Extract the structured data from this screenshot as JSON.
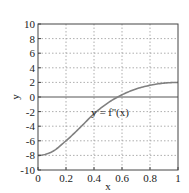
{
  "chart_data": {
    "type": "line",
    "title": "",
    "xlabel": "x",
    "ylabel": "y",
    "xlim": [
      0,
      1
    ],
    "ylim": [
      -10,
      10
    ],
    "grid": true,
    "xticks": [
      0,
      0.2,
      0.4,
      0.6,
      0.8,
      1
    ],
    "xtick_labels": [
      "0",
      "0.2",
      "0.4",
      "0.6",
      "0.8",
      "1"
    ],
    "yticks": [
      -10,
      -8,
      -6,
      -4,
      -2,
      0,
      2,
      4,
      6,
      8,
      10
    ],
    "ytick_labels": [
      "-10",
      "-8",
      "-6",
      "-4",
      "-2",
      "0",
      "2",
      "4",
      "6",
      "8",
      "10"
    ],
    "hline": 0,
    "series": [
      {
        "name": "y = f''(x)",
        "color": "#808080",
        "x": [
          0,
          0.1,
          0.2,
          0.3,
          0.4,
          0.5,
          0.6,
          0.7,
          0.8,
          0.9,
          1.0
        ],
        "y": [
          -8.0,
          -7.5,
          -6.0,
          -4.2,
          -2.3,
          -0.8,
          0.3,
          1.1,
          1.6,
          1.9,
          2.0
        ]
      }
    ],
    "annotations": [
      {
        "text": "y = f''(x)",
        "x": 0.5,
        "y": -2.5
      }
    ]
  },
  "colors": {
    "frame": "#444444",
    "grid": "#999999",
    "curve": "#808080"
  }
}
